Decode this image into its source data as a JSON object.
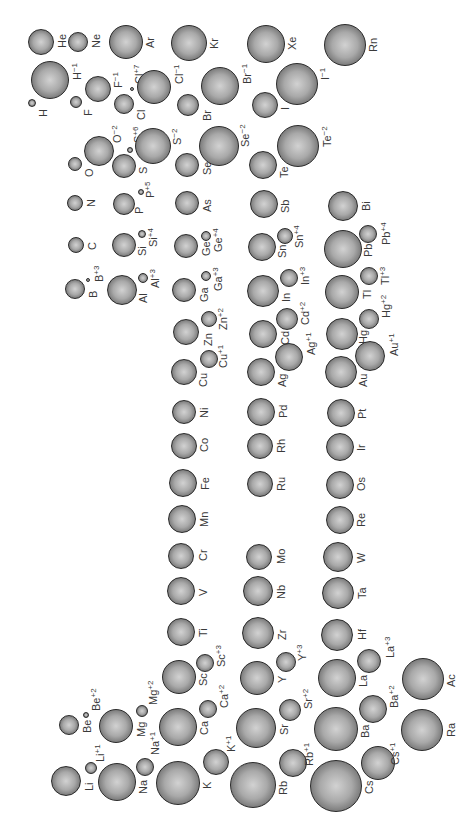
{
  "figure": {
    "title": "",
    "orientation": "rotated 90° (read with the page turned clockwise)"
  },
  "chart_data": {
    "type": "diagram",
    "atoms": [
      {
        "symbol": "H",
        "charge": ""
      },
      {
        "symbol": "He",
        "charge": ""
      },
      {
        "symbol": "Li",
        "charge": ""
      },
      {
        "symbol": "Be",
        "charge": ""
      },
      {
        "symbol": "B",
        "charge": ""
      },
      {
        "symbol": "C",
        "charge": ""
      },
      {
        "symbol": "N",
        "charge": ""
      },
      {
        "symbol": "O",
        "charge": ""
      },
      {
        "symbol": "F",
        "charge": ""
      },
      {
        "symbol": "Ne",
        "charge": ""
      },
      {
        "symbol": "Na",
        "charge": ""
      },
      {
        "symbol": "Mg",
        "charge": ""
      },
      {
        "symbol": "Al",
        "charge": ""
      },
      {
        "symbol": "Si",
        "charge": ""
      },
      {
        "symbol": "P",
        "charge": ""
      },
      {
        "symbol": "S",
        "charge": ""
      },
      {
        "symbol": "Cl",
        "charge": ""
      },
      {
        "symbol": "Ar",
        "charge": ""
      },
      {
        "symbol": "K",
        "charge": ""
      },
      {
        "symbol": "Ca",
        "charge": ""
      },
      {
        "symbol": "Sc",
        "charge": ""
      },
      {
        "symbol": "Ti",
        "charge": ""
      },
      {
        "symbol": "V",
        "charge": ""
      },
      {
        "symbol": "Cr",
        "charge": ""
      },
      {
        "symbol": "Mn",
        "charge": ""
      },
      {
        "symbol": "Fe",
        "charge": ""
      },
      {
        "symbol": "Co",
        "charge": ""
      },
      {
        "symbol": "Ni",
        "charge": ""
      },
      {
        "symbol": "Cu",
        "charge": ""
      },
      {
        "symbol": "Zn",
        "charge": ""
      },
      {
        "symbol": "Ga",
        "charge": ""
      },
      {
        "symbol": "Ge",
        "charge": ""
      },
      {
        "symbol": "As",
        "charge": ""
      },
      {
        "symbol": "Se",
        "charge": ""
      },
      {
        "symbol": "Br",
        "charge": ""
      },
      {
        "symbol": "Kr",
        "charge": ""
      },
      {
        "symbol": "Rb",
        "charge": ""
      },
      {
        "symbol": "Sr",
        "charge": ""
      },
      {
        "symbol": "Y",
        "charge": ""
      },
      {
        "symbol": "Zr",
        "charge": ""
      },
      {
        "symbol": "Nb",
        "charge": ""
      },
      {
        "symbol": "Mo",
        "charge": ""
      },
      {
        "symbol": "Ru",
        "charge": ""
      },
      {
        "symbol": "Rh",
        "charge": ""
      },
      {
        "symbol": "Pd",
        "charge": ""
      },
      {
        "symbol": "Ag",
        "charge": ""
      },
      {
        "symbol": "Cd",
        "charge": ""
      },
      {
        "symbol": "In",
        "charge": ""
      },
      {
        "symbol": "Sn",
        "charge": ""
      },
      {
        "symbol": "Sb",
        "charge": ""
      },
      {
        "symbol": "Te",
        "charge": ""
      },
      {
        "symbol": "I",
        "charge": ""
      },
      {
        "symbol": "Xe",
        "charge": ""
      },
      {
        "symbol": "Cs",
        "charge": ""
      },
      {
        "symbol": "Ba",
        "charge": ""
      },
      {
        "symbol": "La",
        "charge": ""
      },
      {
        "symbol": "Hf",
        "charge": ""
      },
      {
        "symbol": "Ta",
        "charge": ""
      },
      {
        "symbol": "W",
        "charge": ""
      },
      {
        "symbol": "Re",
        "charge": ""
      },
      {
        "symbol": "Os",
        "charge": ""
      },
      {
        "symbol": "Ir",
        "charge": ""
      },
      {
        "symbol": "Pt",
        "charge": ""
      },
      {
        "symbol": "Au",
        "charge": ""
      },
      {
        "symbol": "Hg",
        "charge": ""
      },
      {
        "symbol": "Tl",
        "charge": ""
      },
      {
        "symbol": "Pb",
        "charge": ""
      },
      {
        "symbol": "Bi",
        "charge": ""
      },
      {
        "symbol": "Rn",
        "charge": ""
      },
      {
        "symbol": "Ra",
        "charge": ""
      },
      {
        "symbol": "Ac",
        "charge": ""
      }
    ],
    "ions": [
      {
        "symbol": "H",
        "charge": "−1"
      },
      {
        "symbol": "Li",
        "charge": "+1"
      },
      {
        "symbol": "Be",
        "charge": "+2"
      },
      {
        "symbol": "B",
        "charge": "+3"
      },
      {
        "symbol": "O",
        "charge": "−2"
      },
      {
        "symbol": "F",
        "charge": "−1"
      },
      {
        "symbol": "Na",
        "charge": "+1"
      },
      {
        "symbol": "Mg",
        "charge": "+2"
      },
      {
        "symbol": "Al",
        "charge": "+3"
      },
      {
        "symbol": "Si",
        "charge": "+4"
      },
      {
        "symbol": "P",
        "charge": "+5"
      },
      {
        "symbol": "S",
        "charge": "+6"
      },
      {
        "symbol": "S",
        "charge": "−2"
      },
      {
        "symbol": "Cl",
        "charge": "+7"
      },
      {
        "symbol": "Cl",
        "charge": "−1"
      },
      {
        "symbol": "K",
        "charge": "+1"
      },
      {
        "symbol": "Ca",
        "charge": "+2"
      },
      {
        "symbol": "Sc",
        "charge": "+3"
      },
      {
        "symbol": "Cu",
        "charge": "+1"
      },
      {
        "symbol": "Zn",
        "charge": "+2"
      },
      {
        "symbol": "Ga",
        "charge": "+3"
      },
      {
        "symbol": "Ge",
        "charge": "+4"
      },
      {
        "symbol": "Se",
        "charge": "−2"
      },
      {
        "symbol": "Br",
        "charge": "−1"
      },
      {
        "symbol": "Rb",
        "charge": "+1"
      },
      {
        "symbol": "Sr",
        "charge": "+2"
      },
      {
        "symbol": "Y",
        "charge": "+3"
      },
      {
        "symbol": "Ag",
        "charge": "+1"
      },
      {
        "symbol": "Cd",
        "charge": "+2"
      },
      {
        "symbol": "In",
        "charge": "+3"
      },
      {
        "symbol": "Sn",
        "charge": "+4"
      },
      {
        "symbol": "Te",
        "charge": "−2"
      },
      {
        "symbol": "I",
        "charge": "−1"
      },
      {
        "symbol": "Cs",
        "charge": "+1"
      },
      {
        "symbol": "Ba",
        "charge": "+2"
      },
      {
        "symbol": "La",
        "charge": "+3"
      },
      {
        "symbol": "Au",
        "charge": "+1"
      },
      {
        "symbol": "Hg",
        "charge": "+2"
      },
      {
        "symbol": "Tl",
        "charge": "+3"
      },
      {
        "symbol": "Pb",
        "charge": "+4"
      }
    ]
  }
}
